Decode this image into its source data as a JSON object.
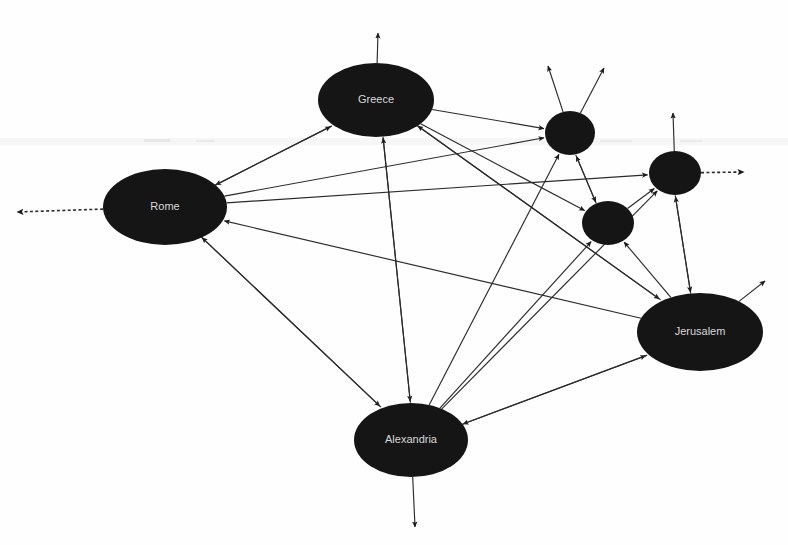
{
  "diagram": {
    "type": "directed-graph",
    "canvas": {
      "width": 788,
      "height": 545,
      "background": "#ffffff"
    },
    "style": {
      "node_fill": "#151515",
      "node_label_color": "#d8d8d8",
      "edge_color": "#2b2b2b",
      "edge_width": 1.15,
      "arrowhead": "filled-triangle"
    },
    "nodes": [
      {
        "id": "rome",
        "label": "Rome",
        "cx": 165,
        "cy": 207,
        "rx": 62,
        "ry": 38,
        "labeled": true
      },
      {
        "id": "greece",
        "label": "Greece",
        "cx": 376,
        "cy": 100,
        "rx": 58,
        "ry": 37,
        "labeled": true
      },
      {
        "id": "alexandria",
        "label": "Alexandria",
        "cx": 411,
        "cy": 440,
        "rx": 57,
        "ry": 37,
        "labeled": true
      },
      {
        "id": "jerusalem",
        "label": "Jerusalem",
        "cx": 700,
        "cy": 332,
        "rx": 63,
        "ry": 39,
        "labeled": true
      },
      {
        "id": "node-a",
        "label": "",
        "cx": 570,
        "cy": 133,
        "rx": 25,
        "ry": 22,
        "labeled": false
      },
      {
        "id": "node-b",
        "label": "",
        "cx": 608,
        "cy": 223,
        "rx": 26,
        "ry": 22,
        "labeled": false
      },
      {
        "id": "node-c",
        "label": "",
        "cx": 675,
        "cy": 173,
        "rx": 26,
        "ry": 22,
        "labeled": false
      }
    ],
    "edges": [
      {
        "from": "greece",
        "to": "rome",
        "directed": true
      },
      {
        "from": "rome",
        "to": "greece",
        "directed": true
      },
      {
        "from": "rome",
        "to": "alexandria",
        "directed": true
      },
      {
        "from": "alexandria",
        "to": "rome",
        "directed": true
      },
      {
        "from": "greece",
        "to": "alexandria",
        "directed": true
      },
      {
        "from": "alexandria",
        "to": "greece",
        "directed": true
      },
      {
        "from": "greece",
        "to": "node-a",
        "directed": true
      },
      {
        "from": "greece",
        "to": "node-b",
        "directed": true
      },
      {
        "from": "greece",
        "to": "jerusalem",
        "directed": true
      },
      {
        "from": "rome",
        "to": "node-a",
        "directed": true
      },
      {
        "from": "rome",
        "to": "node-c",
        "directed": true
      },
      {
        "from": "jerusalem",
        "to": "rome",
        "directed": true
      },
      {
        "from": "jerusalem",
        "to": "greece",
        "directed": true
      },
      {
        "from": "jerusalem",
        "to": "alexandria",
        "directed": true
      },
      {
        "from": "alexandria",
        "to": "jerusalem",
        "directed": true
      },
      {
        "from": "alexandria",
        "to": "node-a",
        "directed": true
      },
      {
        "from": "alexandria",
        "to": "node-b",
        "directed": true
      },
      {
        "from": "alexandria",
        "to": "node-c",
        "directed": true
      },
      {
        "from": "node-b",
        "to": "node-a",
        "directed": true
      },
      {
        "from": "node-b",
        "to": "node-c",
        "directed": true
      },
      {
        "from": "node-a",
        "to": "node-b",
        "directed": true
      },
      {
        "from": "jerusalem",
        "to": "node-b",
        "directed": true
      },
      {
        "from": "jerusalem",
        "to": "node-c",
        "directed": true
      },
      {
        "from": "node-c",
        "to": "jerusalem",
        "directed": true
      }
    ],
    "stub_edges": [
      {
        "from": "greece",
        "x2": 378,
        "y2": 33,
        "dashed": false,
        "name": "greece-up-stub"
      },
      {
        "from": "rome",
        "x2": 17,
        "y2": 212,
        "dashed": true,
        "name": "rome-left-stub"
      },
      {
        "from": "alexandria",
        "x2": 415,
        "y2": 527,
        "dashed": false,
        "name": "alexandria-down-stub"
      },
      {
        "from": "node-a",
        "x2": 548,
        "y2": 66,
        "dashed": false,
        "name": "node-a-upleft-stub"
      },
      {
        "from": "node-a",
        "x2": 604,
        "y2": 68,
        "dashed": false,
        "name": "node-a-upright-stub"
      },
      {
        "from": "node-c",
        "x2": 673,
        "y2": 113,
        "dashed": false,
        "name": "node-c-up-stub"
      },
      {
        "from": "node-c",
        "x2": 744,
        "y2": 172,
        "dashed": true,
        "name": "node-c-right-stub"
      },
      {
        "from": "jerusalem",
        "x2": 765,
        "y2": 281,
        "dashed": false,
        "name": "jerusalem-upright-stub"
      }
    ]
  }
}
